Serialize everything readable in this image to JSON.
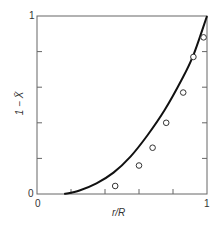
{
  "chart_data": {
    "type": "scatter",
    "title": "",
    "xlabel": "r/R",
    "ylabel": "1 − X̄",
    "xlim": [
      0,
      1
    ],
    "ylim": [
      0,
      1
    ],
    "x_ticks": [
      "0",
      "1"
    ],
    "y_ticks": [
      "0",
      "1"
    ],
    "minor_tick_step": 0.2,
    "grid": false,
    "legend": null,
    "series": [
      {
        "name": "data",
        "kind": "scatter",
        "marker": "open-circle",
        "x": [
          0.46,
          0.6,
          0.68,
          0.76,
          0.86,
          0.92,
          0.98
        ],
        "y": [
          0.045,
          0.16,
          0.26,
          0.4,
          0.57,
          0.77,
          0.88
        ]
      },
      {
        "name": "model",
        "kind": "line",
        "x": [
          0.16,
          0.25,
          0.35,
          0.45,
          0.55,
          0.65,
          0.75,
          0.85,
          0.92,
          1.0
        ],
        "y": [
          0.0,
          0.02,
          0.06,
          0.12,
          0.21,
          0.33,
          0.47,
          0.64,
          0.78,
          1.0
        ]
      }
    ]
  },
  "axes": {
    "y_top_label": "1",
    "y_bottom_label": "0",
    "x_left_label": "0",
    "x_right_label": "1",
    "x_title": "r/R",
    "y_title": "1 − X̄"
  }
}
